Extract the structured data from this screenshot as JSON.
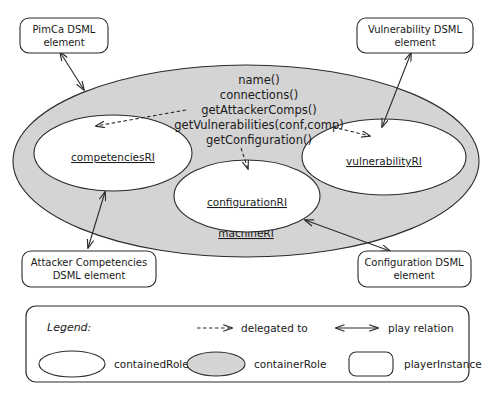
{
  "diagram": {
    "container_role": {
      "name": "machineRI",
      "fill_color": "#d4d4d4",
      "methods": [
        "name()",
        "connections()",
        "getAttackerComps()",
        "getVulnerabilities(conf,comp)",
        "getConfiguration()"
      ]
    },
    "contained_roles": [
      {
        "id": "competencies",
        "name": "competenciesRI"
      },
      {
        "id": "configuration",
        "name": "configurationRI"
      },
      {
        "id": "vulnerability",
        "name": "vulnerabilityRI"
      }
    ],
    "player_instances": [
      {
        "id": "pimca",
        "line1": "PimCa DSML",
        "line2": "element"
      },
      {
        "id": "vulnerability",
        "line1": "Vulnerability  DSML",
        "line2": "element"
      },
      {
        "id": "attacker",
        "line1": "Attacker  Competencies",
        "line2": "DSML element"
      },
      {
        "id": "configuration",
        "line1": "Configuration  DSML",
        "line2": "element"
      }
    ],
    "relations": [
      {
        "kind": "delegated to",
        "from": "getAttackerComps()",
        "to": "competenciesRI"
      },
      {
        "kind": "delegated to",
        "from": "getVulnerabilities(conf,comp)",
        "to": "vulnerabilityRI"
      },
      {
        "kind": "delegated to",
        "from": "getConfiguration()",
        "to": "configurationRI"
      },
      {
        "kind": "play relation",
        "from": "PimCa DSML element",
        "to": "machineRI"
      },
      {
        "kind": "play relation",
        "from": "Vulnerability DSML element",
        "to": "vulnerabilityRI"
      },
      {
        "kind": "play relation",
        "from": "Attacker Competencies DSML element",
        "to": "competenciesRI"
      },
      {
        "kind": "play relation",
        "from": "Configuration DSML element",
        "to": "configurationRI"
      }
    ]
  },
  "legend": {
    "title": "Legend:",
    "arrow_entries": [
      {
        "id": "delegated",
        "symbol": "dashed-arrow-icon",
        "label": "delegated to"
      },
      {
        "id": "play",
        "symbol": "double-arrow-icon",
        "label": "play relation"
      }
    ],
    "shape_entries": [
      {
        "id": "contained",
        "symbol": "white-ellipse-icon",
        "label": "containedRole"
      },
      {
        "id": "container",
        "symbol": "gray-ellipse-icon",
        "label": "containerRole"
      },
      {
        "id": "player",
        "symbol": "rounded-box-icon",
        "label": "playerInstance"
      }
    ]
  },
  "colors": {
    "container_fill": "#d4d4d4",
    "contained_fill": "#ffffff",
    "stroke": "#2b2b2b",
    "background": "#ffffff"
  }
}
